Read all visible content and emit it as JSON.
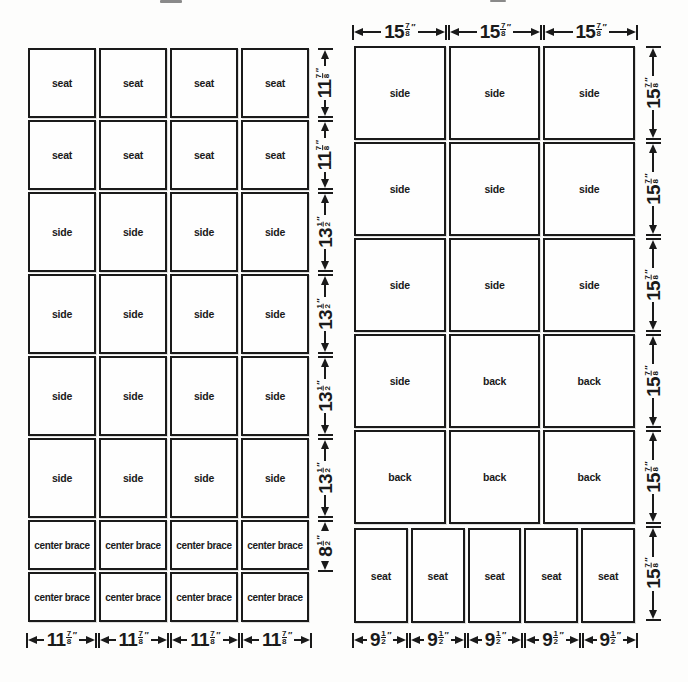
{
  "unit_mark": "″",
  "left_panel": {
    "rows": [
      {
        "cells": [
          "seat",
          "seat",
          "seat",
          "seat"
        ],
        "dim": {
          "whole": "11",
          "num": "7",
          "den": "8"
        }
      },
      {
        "cells": [
          "seat",
          "seat",
          "seat",
          "seat"
        ],
        "dim": {
          "whole": "11",
          "num": "7",
          "den": "8"
        }
      },
      {
        "cells": [
          "side",
          "side",
          "side",
          "side"
        ],
        "dim": {
          "whole": "13",
          "num": "1",
          "den": "2"
        }
      },
      {
        "cells": [
          "side",
          "side",
          "side",
          "side"
        ],
        "dim": {
          "whole": "13",
          "num": "1",
          "den": "2"
        }
      },
      {
        "cells": [
          "side",
          "side",
          "side",
          "side"
        ],
        "dim": {
          "whole": "13",
          "num": "1",
          "den": "2"
        }
      },
      {
        "cells": [
          "side",
          "side",
          "side",
          "side"
        ],
        "dim": {
          "whole": "13",
          "num": "1",
          "den": "2"
        }
      },
      {
        "cells": [
          "center brace",
          "center brace",
          "center brace",
          "center brace"
        ],
        "dim": {
          "whole": "8",
          "num": "1",
          "den": "2"
        }
      },
      {
        "cells": [
          "center brace",
          "center brace",
          "center brace",
          "center brace"
        ],
        "dim": null
      }
    ],
    "bottom_dims": [
      {
        "whole": "11",
        "num": "7",
        "den": "8"
      },
      {
        "whole": "11",
        "num": "7",
        "den": "8"
      },
      {
        "whole": "11",
        "num": "7",
        "den": "8"
      },
      {
        "whole": "11",
        "num": "7",
        "den": "8"
      }
    ]
  },
  "right_panel": {
    "top_dims": [
      {
        "whole": "15",
        "num": "7",
        "den": "8"
      },
      {
        "whole": "15",
        "num": "7",
        "den": "8"
      },
      {
        "whole": "15",
        "num": "7",
        "den": "8"
      }
    ],
    "rows": [
      {
        "cells": [
          "side",
          "side",
          "side"
        ],
        "dim": {
          "whole": "15",
          "num": "7",
          "den": "8"
        }
      },
      {
        "cells": [
          "side",
          "side",
          "side"
        ],
        "dim": {
          "whole": "15",
          "num": "7",
          "den": "8"
        }
      },
      {
        "cells": [
          "side",
          "side",
          "side"
        ],
        "dim": {
          "whole": "15",
          "num": "7",
          "den": "8"
        }
      },
      {
        "cells": [
          "side",
          "back",
          "back"
        ],
        "dim": {
          "whole": "15",
          "num": "7",
          "den": "8"
        }
      },
      {
        "cells": [
          "back",
          "back",
          "back"
        ],
        "dim": {
          "whole": "15",
          "num": "7",
          "den": "8"
        }
      }
    ],
    "seat_row": {
      "cells": [
        "seat",
        "seat",
        "seat",
        "seat",
        "seat"
      ],
      "dim": {
        "whole": "15",
        "num": "7",
        "den": "8"
      }
    },
    "bottom_dims": [
      {
        "whole": "9",
        "num": "1",
        "den": "2"
      },
      {
        "whole": "9",
        "num": "1",
        "den": "2"
      },
      {
        "whole": "9",
        "num": "1",
        "den": "2"
      },
      {
        "whole": "9",
        "num": "1",
        "den": "2"
      },
      {
        "whole": "9",
        "num": "1",
        "den": "2"
      }
    ]
  }
}
